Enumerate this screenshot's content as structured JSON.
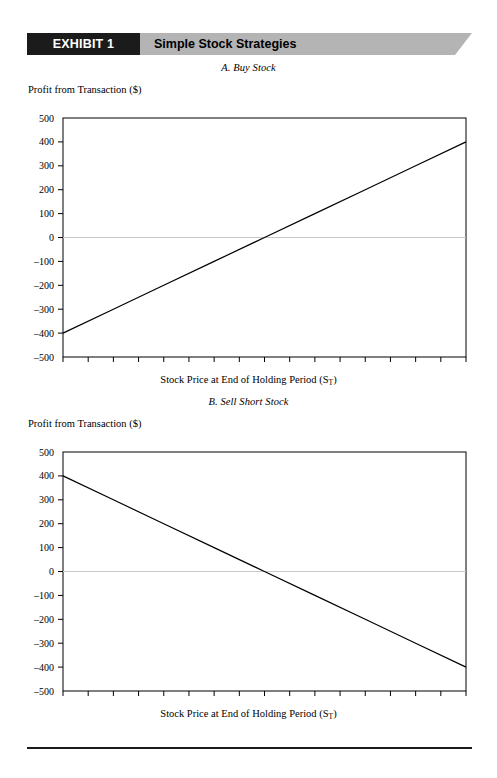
{
  "banner": {
    "exhibit_label": "EXHIBIT 1",
    "title": "Simple Stock Strategies",
    "label_bg_color": "#1b1b1b",
    "title_bg_color": "#b4b4b4",
    "label_text_color": "#ffffff"
  },
  "footer": {
    "rule_color": "#1a1a1a"
  },
  "chart_data": [
    {
      "id": "panel-a",
      "type": "line",
      "title": "A. Buy Stock",
      "xlabel": "Stock Price at End of Holding Period (S",
      "xlabel_sub": "T",
      "xlabel_tail": ")",
      "ylabel": "Profit from Transaction ($)",
      "xlim": [
        1600,
        2400
      ],
      "ylim": [
        -500,
        500
      ],
      "xticks": [
        1600,
        1650,
        1700,
        1750,
        1800,
        1850,
        1900,
        1950,
        2000,
        2050,
        2100,
        2150,
        2200,
        2250,
        2300,
        2350,
        2400
      ],
      "yticks": [
        500,
        400,
        300,
        200,
        100,
        0,
        -100,
        -200,
        -300,
        -400,
        -500
      ],
      "ytick_labels": [
        "500",
        "400",
        "300",
        "200",
        "100",
        "0",
        "–100",
        "–200",
        "–300",
        "–400",
        "–500"
      ],
      "grid": false,
      "zero_line": true,
      "zero_line_color": "#c8c8c8",
      "line_color": "#000000",
      "series": [
        {
          "name": "Buy Stock payoff",
          "x": [
            1600,
            1700,
            1800,
            1900,
            2000,
            2100,
            2200,
            2300,
            2400
          ],
          "values": [
            -400,
            -300,
            -200,
            -100,
            0,
            100,
            200,
            300,
            400
          ]
        }
      ]
    },
    {
      "id": "panel-b",
      "type": "line",
      "title": "B. Sell Short Stock",
      "xlabel": "Stock Price at End of Holding Period (S",
      "xlabel_sub": "T",
      "xlabel_tail": ")",
      "ylabel": "Profit from Transaction ($)",
      "xlim": [
        1600,
        2400
      ],
      "ylim": [
        -500,
        500
      ],
      "xticks": [
        1600,
        1650,
        1700,
        1750,
        1800,
        1850,
        1900,
        1950,
        2000,
        2050,
        2100,
        2150,
        2200,
        2250,
        2300,
        2350,
        2400
      ],
      "yticks": [
        500,
        400,
        300,
        200,
        100,
        0,
        -100,
        -200,
        -300,
        -400,
        -500
      ],
      "ytick_labels": [
        "500",
        "400",
        "300",
        "200",
        "100",
        "0",
        "–100",
        "–200",
        "–300",
        "–400",
        "–500"
      ],
      "grid": false,
      "zero_line": true,
      "zero_line_color": "#c8c8c8",
      "line_color": "#000000",
      "series": [
        {
          "name": "Sell Short Stock payoff",
          "x": [
            1600,
            1700,
            1800,
            1900,
            2000,
            2100,
            2200,
            2300,
            2400
          ],
          "values": [
            400,
            300,
            200,
            100,
            0,
            -100,
            -200,
            -300,
            -400
          ]
        }
      ]
    }
  ]
}
